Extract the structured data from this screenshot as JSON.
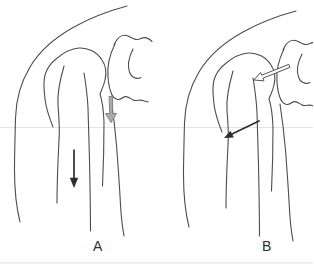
{
  "figure": {
    "type": "medical-line-illustration",
    "panels": [
      {
        "label": "A",
        "arrows": [
          {
            "name": "gray-down-arrow",
            "style": "gray-filled-outlined",
            "direction": "down",
            "location": "at glenoid joint line"
          },
          {
            "name": "black-down-arrow",
            "style": "solid-black",
            "direction": "down",
            "location": "along humeral shaft"
          }
        ]
      },
      {
        "label": "B",
        "arrows": [
          {
            "name": "open-left-arrow",
            "style": "white-outlined",
            "direction": "down-left",
            "location": "from glenoid into humeral head"
          },
          {
            "name": "black-diagonal-arrow",
            "style": "solid-black",
            "direction": "down-left",
            "location": "at surgical neck of humerus"
          }
        ]
      }
    ],
    "colors": {
      "background": "#ffffff",
      "line": "#4d4d4d",
      "gray_arrow_fill": "#aaaaaa",
      "gray_arrow_stroke": "#7d7d7d",
      "open_arrow_fill": "#ffffff",
      "open_arrow_stroke": "#555555",
      "black_arrow": "#2e2e2e",
      "faint_rule": "#e4e4e4",
      "label_text": "#2f2f2f"
    }
  }
}
